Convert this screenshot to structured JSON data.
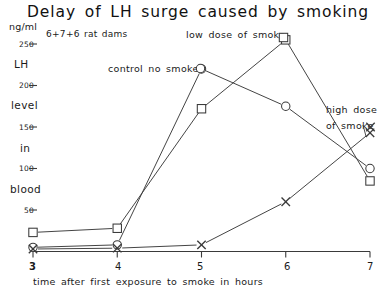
{
  "chart_data": {
    "type": "line",
    "title": "Delay of LH surge caused by smoking",
    "subtitle": "6+7+6 rat dams",
    "xlabel": "time after first exposure to smoke in hours",
    "ylabel": "LH level in blood",
    "yunit": "ng/ml",
    "x": [
      3,
      4,
      5,
      6,
      7
    ],
    "xticklabels": [
      "3",
      "4",
      "5",
      "6",
      "7"
    ],
    "yticks": [
      50,
      100,
      150,
      200,
      250
    ],
    "yticklabels": [
      "50",
      "100",
      "150",
      "200",
      "250"
    ],
    "ylim": [
      0,
      262
    ],
    "xlim": [
      2.85,
      7.15
    ],
    "grid": false,
    "legend_position": "inline-annotations",
    "series": [
      {
        "name": "control no smoke",
        "marker": "circle",
        "values": [
          5,
          8,
          220,
          175,
          100
        ]
      },
      {
        "name": "low dose of smoke",
        "marker": "square",
        "values": [
          23,
          28,
          172,
          255,
          85
        ]
      },
      {
        "name": "high dose of smoke",
        "marker": "x",
        "values": [
          3,
          4,
          8,
          60,
          143
        ]
      }
    ],
    "annotations": [
      {
        "text": "control no smoke",
        "marker": "circle",
        "x": 5,
        "y": 220
      },
      {
        "text": "low dose of smoke",
        "marker": "square",
        "x": 6,
        "y": 255
      },
      {
        "text": "high dose",
        "text2": "of smoke",
        "marker": "x",
        "x": 7,
        "y": 143
      }
    ]
  },
  "axis": {
    "unit": "ng/ml",
    "y_words": [
      "LH",
      "level",
      "in",
      "blood"
    ],
    "x_title": "time after first exposure to smoke in hours"
  }
}
